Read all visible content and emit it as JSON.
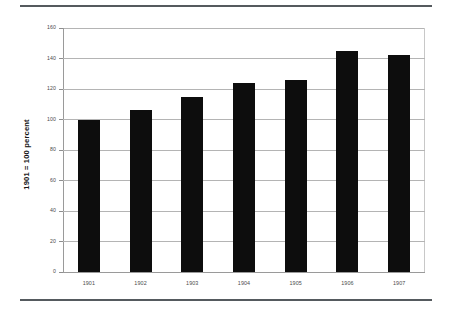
{
  "chart_data": {
    "type": "bar",
    "title": "",
    "subtitle": "",
    "xlabel": "",
    "ylabel": "1901 = 100 percent",
    "categories": [
      "1901",
      "1902",
      "1903",
      "1904",
      "1905",
      "1906",
      "1907"
    ],
    "values": [
      100,
      106,
      115,
      124,
      126,
      145,
      142
    ],
    "series": [
      {
        "name": "index",
        "values": [
          100,
          106,
          115,
          124,
          126,
          145,
          142
        ]
      }
    ],
    "ylim": [
      0,
      160
    ],
    "yticks": [
      0,
      20,
      40,
      60,
      80,
      100,
      120,
      140,
      160
    ],
    "ytick_labels": [
      "0",
      "20",
      "40",
      "60",
      "80",
      "100",
      "120",
      "140",
      "160"
    ],
    "grid": "horizontal",
    "legend": "none",
    "bar_color": "#0d0d0d",
    "grid_color": "#b4b4b4",
    "axis_color": "#9a9a9a",
    "background_color": "#ffffff",
    "rule_color": "#555a5e"
  }
}
